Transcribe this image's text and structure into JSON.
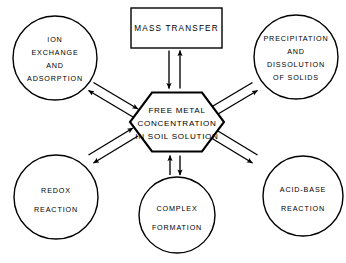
{
  "figure": {
    "type": "process-relationship-diagram",
    "background_color": "#ffffff",
    "line_color": "#000000",
    "width": 346,
    "height": 263
  },
  "center_node": {
    "shape": "hexagon",
    "lines": [
      "FREE  METAL",
      "CONCENTRATION",
      "IN SOIL SOLUTION"
    ],
    "line1": "FREE  METAL",
    "line2": "CONCENTRATION",
    "line3": "IN SOIL SOLUTION"
  },
  "box_node": {
    "shape": "rectangle",
    "label": "MASS TRANSFER",
    "position": "top"
  },
  "circle_nodes": [
    {
      "id": "ion-exchange-and-adsorption",
      "shape": "circle",
      "position": "top-left",
      "lines": [
        "ION",
        "EXCHANGE",
        "AND",
        "ADSORPTION"
      ],
      "line1": "ION",
      "line2": "EXCHANGE",
      "line3": "AND",
      "line4": "ADSORPTION"
    },
    {
      "id": "precipitation-and-dissolution-of-solids",
      "shape": "circle",
      "position": "top-right",
      "lines": [
        "PRECIPITATION",
        "AND",
        "DISSOLUTION",
        "OF SOLIDS"
      ],
      "line1": "PRECIPITATION",
      "line2": "AND",
      "line3": "DISSOLUTION",
      "line4": "OF SOLIDS"
    },
    {
      "id": "redox-reaction",
      "shape": "circle",
      "position": "bottom-left",
      "lines": [
        "REDOX",
        "REACTION"
      ],
      "line1": "REDOX",
      "line2": "REACTION"
    },
    {
      "id": "complex-formation",
      "shape": "circle",
      "position": "bottom-center",
      "lines": [
        "COMPLEX",
        "FORMATION"
      ],
      "line1": "COMPLEX",
      "line2": "FORMATION"
    },
    {
      "id": "acid-base-reaction",
      "shape": "circle",
      "position": "bottom-right",
      "lines": [
        "ACID-BASE",
        "REACTION"
      ],
      "line1": "ACID-BASE",
      "line2": "REACTION"
    }
  ],
  "connectors": [
    {
      "id": "mass-transfer",
      "from": "center-hexagon",
      "to": "mass-transfer-box",
      "style": "double-line-bidirectional"
    },
    {
      "id": "ion-exchange",
      "from": "center-hexagon",
      "to": "ion-exchange-and-adsorption",
      "style": "double-line-bidirectional"
    },
    {
      "id": "precipitation",
      "from": "center-hexagon",
      "to": "precipitation-and-dissolution-of-solids",
      "style": "double-line-bidirectional"
    },
    {
      "id": "redox",
      "from": "center-hexagon",
      "to": "redox-reaction",
      "style": "double-line-bidirectional"
    },
    {
      "id": "complex",
      "from": "center-hexagon",
      "to": "complex-formation",
      "style": "double-line-bidirectional"
    },
    {
      "id": "acid-base",
      "from": "center-hexagon",
      "to": "acid-base-reaction",
      "style": "double-line-bidirectional"
    }
  ]
}
